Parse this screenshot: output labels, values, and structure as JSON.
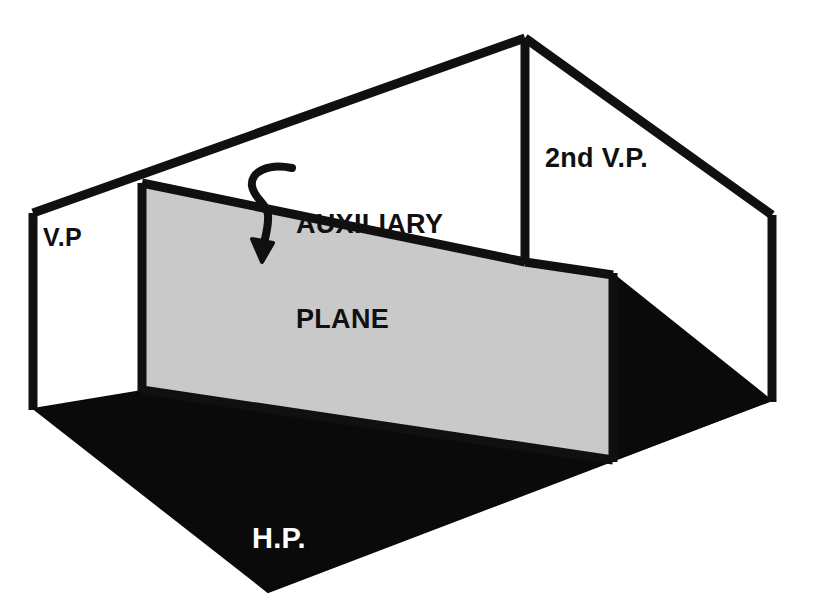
{
  "diagram": {
    "background_color": "#ffffff",
    "line_color": "#101010",
    "horizontal_plane_fill": "#0a0a0a",
    "auxiliary_plane_fill": "#c9c9c9",
    "vertical_plane_fill": "#ffffff",
    "labels": {
      "vertical_plane": "V.P",
      "auxiliary_plane_line1": "AUXILIARY",
      "auxiliary_plane_line2": "PLANE",
      "second_vertical_plane": "2nd V.P.",
      "horizontal_plane": "H.P."
    },
    "label_colors": {
      "vertical_plane": "#101010",
      "auxiliary_plane": "#101010",
      "second_vertical_plane": "#101010",
      "horizontal_plane": "#ffffff"
    },
    "geometry": {
      "apex": "525,38",
      "vertical_plane_panel": "33,213 142,183 142,390 33,408",
      "auxiliary_plane_panel": "142,183 525,262 613,273 613,460 142,390",
      "horizontal_plane_panel": "33,408 142,390 613,460 772,400 268,592",
      "second_vertical_plane_panel": "525,38 772,215 772,400 613,273 525,262",
      "roof_left_edge": "33,213 525,38",
      "roof_right_edge": "525,38 772,215",
      "center_fold_line": "525,38 525,262",
      "right_vertical_edge": "772,215 772,400",
      "left_vertical_edge": "33,213 33,408",
      "auxiliary_fold_line": "142,183 142,390",
      "auxiliary_right_edge": "613,273 613,460",
      "leader_arrow": "curved pointer from AUXILIARY PLANE text down into auxiliary plane"
    }
  }
}
